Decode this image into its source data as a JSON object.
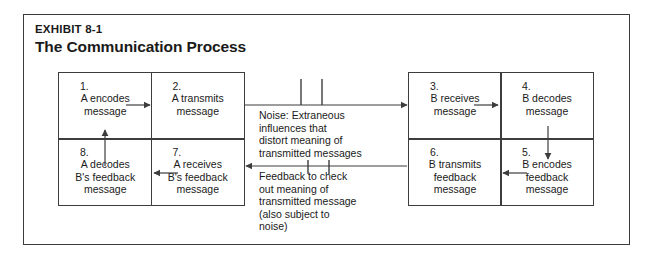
{
  "exhibit": {
    "eyebrow": "EXHIBIT 8-1",
    "title": "The Communication Process"
  },
  "colors": {
    "frame": "#3b3b3b",
    "box_border": "#3d3d3d",
    "text": "#1a1a1a",
    "background": "#ffffff"
  },
  "left_grid": {
    "cells": [
      {
        "number": "1.",
        "lines": [
          "A encodes",
          "message"
        ]
      },
      {
        "number": "2.",
        "lines": [
          "A transmits",
          "message"
        ]
      },
      {
        "number": "8.",
        "lines": [
          "A decodes",
          "B's feedback",
          "message"
        ]
      },
      {
        "number": "7.",
        "lines": [
          "A receives",
          "B's feedback",
          "message"
        ]
      }
    ]
  },
  "right_grid": {
    "cells": [
      {
        "number": "3.",
        "lines": [
          "B receives",
          "message"
        ]
      },
      {
        "number": "4.",
        "lines": [
          "B decodes",
          "message"
        ]
      },
      {
        "number": "6.",
        "lines": [
          "B transmits",
          "feedback",
          "message"
        ]
      },
      {
        "number": "5.",
        "lines": [
          "B encodes",
          "feedback",
          "message"
        ]
      }
    ]
  },
  "noise": {
    "lines": [
      "Noise: Extraneous",
      "influences that",
      "distort meaning of",
      "transmitted messages"
    ]
  },
  "feedback": {
    "lines": [
      "Feedback to check",
      "out meaning of",
      "transmitted message",
      "(also subject to",
      "noise)"
    ]
  }
}
